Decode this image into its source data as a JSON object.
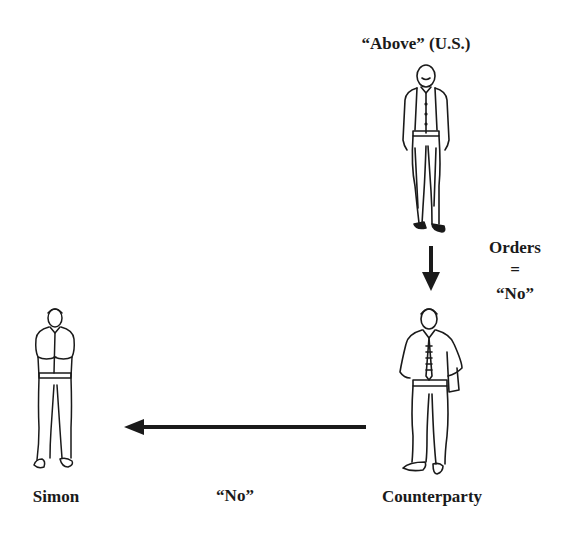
{
  "diagram": {
    "nodes": {
      "above": {
        "label": "“Above” (U.S.)"
      },
      "counterparty": {
        "label": "Counterparty"
      },
      "simon": {
        "label": "Simon"
      }
    },
    "edges": {
      "above_to_counterparty": {
        "label_line1": "Orders",
        "label_line2": "=",
        "label_line3": "“No”"
      },
      "counterparty_to_simon": {
        "label": "“No”"
      }
    },
    "colors": {
      "ink": "#1a1a1a",
      "background": "#ffffff"
    }
  }
}
